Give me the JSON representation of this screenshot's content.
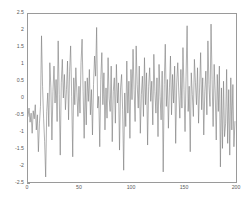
{
  "chart_data": {
    "type": "line",
    "title": "",
    "subtitle": "",
    "xlabel": "",
    "ylabel": "",
    "legend": [],
    "grid": false,
    "xlim": [
      0,
      200
    ],
    "ylim": [
      -2.5,
      2.5
    ],
    "xticks": [
      0,
      50,
      100,
      150,
      200
    ],
    "xtick_labels": [
      "0",
      "50",
      "100",
      "150",
      "200"
    ],
    "yticks": [
      -2.5,
      -2,
      -1.5,
      -1,
      -0.5,
      0,
      0.5,
      1,
      1.5,
      2,
      2.5
    ],
    "ytick_labels": [
      "-2.5",
      "-2",
      "-1.5",
      "-1",
      "-0.5",
      "0",
      "0.5",
      "1",
      "1.5",
      "2",
      "2.5"
    ],
    "line_color": "#7a7a7a",
    "line_width": 0.6,
    "background_color": "#ffffff",
    "axis_color": "#9a9a9a",
    "series": [
      {
        "name": "signal",
        "x_start": 0,
        "x_step": 1,
        "values": [
          -0.55,
          -0.3,
          -0.72,
          -0.45,
          -1.05,
          -0.38,
          -0.62,
          -0.2,
          -0.95,
          -0.5,
          -1.6,
          -0.75,
          -0.25,
          1.85,
          0.35,
          -0.6,
          -1.3,
          -2.35,
          -0.4,
          0.15,
          -0.85,
          1.05,
          0.3,
          -1.25,
          0.2,
          0.95,
          -0.15,
          0.55,
          -0.7,
          1.7,
          0.1,
          -1.7,
          0.45,
          1.15,
          0.0,
          0.7,
          -0.35,
          0.25,
          1.1,
          -0.65,
          0.8,
          1.55,
          0.05,
          -1.75,
          0.6,
          -0.2,
          0.9,
          0.15,
          -0.55,
          0.35,
          -0.45,
          1.05,
          1.75,
          0.2,
          -1.2,
          0.5,
          -0.8,
          0.6,
          -0.1,
          0.85,
          -0.5,
          0.25,
          -1.1,
          0.4,
          1.25,
          0.65,
          2.1,
          -0.3,
          0.05,
          -1.45,
          0.55,
          1.35,
          -0.2,
          0.75,
          -0.95,
          0.3,
          -0.6,
          1.2,
          0.0,
          -0.4,
          0.95,
          -1.3,
          0.2,
          0.6,
          -0.75,
          1.0,
          -0.15,
          0.45,
          -1.55,
          0.3,
          0.7,
          -0.35,
          -2.15,
          0.15,
          -0.85,
          1.1,
          -0.45,
          0.5,
          -1.2,
          0.85,
          -0.05,
          1.45,
          0.25,
          -0.7,
          1.55,
          0.4,
          -0.3,
          0.95,
          -1.05,
          0.1,
          0.65,
          -0.55,
          1.2,
          -0.2,
          0.75,
          -1.4,
          0.35,
          0.9,
          -0.1,
          0.5,
          -0.8,
          1.3,
          0.2,
          -0.45,
          0.6,
          -1.15,
          1.0,
          0.05,
          -0.65,
          0.8,
          -2.2,
          0.4,
          1.6,
          -0.25,
          0.55,
          -0.9,
          0.3,
          1.25,
          -0.5,
          0.7,
          -0.15,
          0.95,
          -1.35,
          0.45,
          1.05,
          0.15,
          -0.6,
          0.85,
          -0.3,
          1.5,
          0.25,
          -1.0,
          0.65,
          2.15,
          -0.4,
          0.35,
          -1.6,
          0.75,
          0.1,
          -0.55,
          1.15,
          0.45,
          -0.2,
          0.9,
          -0.75,
          0.3,
          1.35,
          -0.35,
          0.6,
          -1.1,
          0.2,
          0.8,
          -0.5,
          1.7,
          0.4,
          -0.25,
          2.2,
          0.55,
          -0.85,
          1.0,
          0.15,
          -1.25,
          0.7,
          -0.4,
          0.95,
          -2.05,
          0.3,
          -1.5,
          0.5,
          -1.15,
          -0.75,
          0.85,
          -1.35,
          0.25,
          -1.7,
          0.6,
          -0.95,
          0.4,
          -1.45,
          -0.7
        ]
      }
    ]
  },
  "figure": {
    "type_label": "line-plot"
  }
}
